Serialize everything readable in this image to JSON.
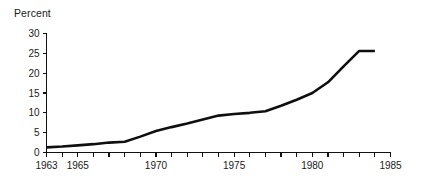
{
  "figure": {
    "axis_label_top": "Percent",
    "line_color": "#100f0f",
    "axis_color": "#111111",
    "background": "#ffffff"
  },
  "chart_data": {
    "type": "line",
    "title": "",
    "subtitle": "",
    "xlabel": "",
    "ylabel": "Percent",
    "xlim": [
      1963,
      1985
    ],
    "ylim": [
      0,
      30
    ],
    "grid": false,
    "legend": false,
    "y_ticks": [
      0,
      5,
      10,
      15,
      20,
      25,
      30
    ],
    "y_tick_labels": [
      "0",
      "5",
      "10",
      "15",
      "20",
      "25",
      "30"
    ],
    "x_ticks": [
      1963,
      1964,
      1965,
      1966,
      1967,
      1968,
      1969,
      1970,
      1971,
      1972,
      1973,
      1974,
      1975,
      1976,
      1977,
      1978,
      1979,
      1980,
      1981,
      1982,
      1983,
      1984,
      1985
    ],
    "x_tick_labels_shown": [
      "1963",
      "1965",
      "1970",
      "1975",
      "1980",
      "1985"
    ],
    "x_labeled_ticks": [
      1963,
      1965,
      1970,
      1975,
      1980,
      1985
    ],
    "series": [
      {
        "name": "Percent",
        "x": [
          1963,
          1964,
          1965,
          1966,
          1967,
          1968,
          1969,
          1970,
          1971,
          1972,
          1973,
          1974,
          1975,
          1976,
          1977,
          1978,
          1979,
          1980,
          1981,
          1982,
          1983,
          1984
        ],
        "values": [
          1.3,
          1.5,
          1.8,
          2.1,
          2.5,
          2.7,
          4.0,
          5.4,
          6.4,
          7.3,
          8.3,
          9.3,
          9.7,
          10.0,
          10.4,
          11.8,
          13.3,
          15.0,
          17.7,
          21.7,
          25.6,
          25.6
        ]
      }
    ]
  }
}
